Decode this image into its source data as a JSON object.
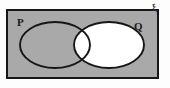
{
  "figure": {
    "kind": "venn-diagram",
    "universal_symbol": "ξ",
    "sets": [
      {
        "id": "P",
        "label": "P",
        "position": "left",
        "shaded": true
      },
      {
        "id": "Q",
        "label": "Q",
        "position": "right",
        "shaded": false
      }
    ],
    "regions": [
      {
        "id": "outside-both-inside-universal",
        "description": "inside rectangle, outside both ellipses",
        "fill": "shaded"
      },
      {
        "id": "p-only",
        "description": "inside P only",
        "fill": "shaded"
      },
      {
        "id": "p-and-q",
        "description": "intersection of P and Q",
        "fill": "unshaded"
      },
      {
        "id": "q-only",
        "description": "inside Q only",
        "fill": "unshaded"
      }
    ],
    "shaded_set_expression": "Q'",
    "colors": {
      "shade": "#a9a9a9",
      "unshaded": "#ffffff",
      "outline": "#171717",
      "page": "#fdfdfd",
      "label": "#1a1a1a"
    },
    "geometry": {
      "rectangle": {
        "x": 7,
        "y": 10,
        "width": 151,
        "height": 68
      },
      "ellipse_p": {
        "cx": 55,
        "cy": 45,
        "rx": 35,
        "ry": 23
      },
      "ellipse_q": {
        "cx": 109,
        "cy": 45,
        "rx": 35,
        "ry": 23
      }
    }
  }
}
